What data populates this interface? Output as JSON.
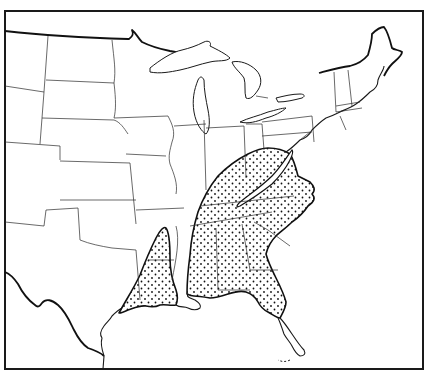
{
  "map": {
    "type": "range-map",
    "region": "Eastern United States",
    "style": "black-and-white line map with stippled range",
    "colors": {
      "background": "#ffffff",
      "lines": "#1a1a1a",
      "stipple": "#111111"
    },
    "legend": null,
    "shaded_regions": [
      {
        "name": "southeastern-range",
        "description": "Stippled area covering the southeastern states from the Appalachians to Florida, with an unshaded gap along the Appalachian ridge"
      },
      {
        "name": "western-gulf-range",
        "description": "Stippled area covering Louisiana and eastern Texas"
      }
    ]
  }
}
